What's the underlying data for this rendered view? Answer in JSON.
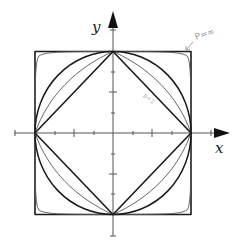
{
  "figure": {
    "axes": {
      "x_label": "x",
      "y_label": "y"
    },
    "curves": [
      {
        "p": "1",
        "shape": "diamond",
        "weight": "thick"
      },
      {
        "p": "1.5",
        "shape": "concave-diamond",
        "weight": "thin"
      },
      {
        "p": "2",
        "shape": "circle",
        "weight": "thick"
      },
      {
        "p": "4",
        "shape": "rounded-square",
        "weight": "thin"
      },
      {
        "p": "∞",
        "shape": "square",
        "weight": "thick"
      }
    ],
    "annotations": {
      "p_infinity": "P=∞",
      "p_one": "p=1"
    },
    "colors": {
      "line": "#1a1a1a",
      "thin_line": "#555555",
      "axis": "#444444",
      "annotation": "#9a9a9a"
    }
  }
}
